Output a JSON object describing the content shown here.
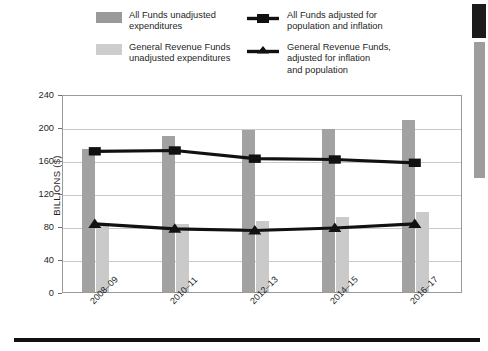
{
  "legend": {
    "items": [
      {
        "id": "all-funds-unadjusted",
        "marker": "swatch-dark",
        "label": "All Funds unadjusted\nexpenditures"
      },
      {
        "id": "grf-unadjusted",
        "marker": "swatch-light",
        "label": "General Revenue Funds\nunadjusted expenditures"
      },
      {
        "id": "all-funds-adjusted",
        "marker": "line-square",
        "label": "All Funds adjusted for\npopulation and inflation"
      },
      {
        "id": "grf-adjusted",
        "marker": "line-triangle",
        "label": "General Revenue Funds,\nadjusted for inflation\nand population"
      }
    ]
  },
  "colors": {
    "bar_all_funds": "#a2a2a2",
    "bar_general_revenue": "#cacaca",
    "series_line": "#111111",
    "gridline": "#c9c9c9",
    "axis": "#9a9a9a"
  },
  "chart_data": {
    "type": "bar",
    "title": "",
    "xlabel": "",
    "ylabel": "BILLIONS ($)",
    "categories": [
      "2008–09",
      "2010–11",
      "2012–13",
      "2014–15",
      "2016–17"
    ],
    "ylim": [
      0,
      240
    ],
    "yticks": [
      0,
      40,
      80,
      120,
      160,
      200,
      240
    ],
    "grid": true,
    "legend_position": "top",
    "series": [
      {
        "name": "All Funds unadjusted expenditures",
        "render": "bar",
        "color": "#a2a2a2",
        "values": [
          173,
          189,
          196,
          198,
          208
        ]
      },
      {
        "name": "General Revenue Funds unadjusted expenditures",
        "render": "bar",
        "color": "#cacaca",
        "values": [
          82,
          83,
          86,
          91,
          97
        ]
      },
      {
        "name": "All Funds adjusted for population and inflation",
        "render": "line",
        "marker": "square",
        "color": "#111111",
        "values": [
          173,
          174,
          164,
          163,
          159
        ]
      },
      {
        "name": "General Revenue Funds, adjusted for inflation and population",
        "render": "line",
        "marker": "triangle",
        "color": "#111111",
        "values": [
          85,
          79,
          77,
          80,
          85
        ]
      }
    ]
  }
}
